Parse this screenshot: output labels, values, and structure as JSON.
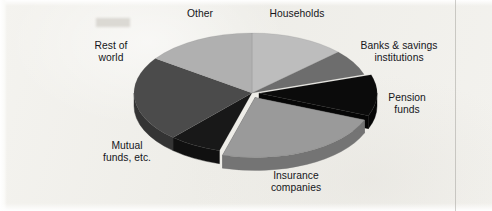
{
  "figure": {
    "background_color": "#f1f0ec",
    "margin_rule_x": 455
  },
  "chart_data": {
    "type": "pie",
    "title": "",
    "subtitle": "",
    "xlabel": "",
    "ylabel": "",
    "legend_position": "none",
    "grid": false,
    "style": "3d-exploded-grayscale",
    "note": "Holders of U.S. corporate equities, shares of total; slice sizes read off the drawn angles.",
    "center": {
      "x": 252,
      "y": 93
    },
    "radius_x": 118,
    "radius_y": 60,
    "depth": 13,
    "start_angle_deg": 0,
    "direction": "clockwise",
    "labels": [
      "Households",
      "Banks & savings institutions",
      "Pension funds",
      "Insurance companies",
      "Mutual funds, etc.",
      "Rest of world",
      "Other"
    ],
    "values": [
      13.1,
      6.9,
      11.1,
      23.3,
      7.2,
      23.1,
      15.3
    ],
    "colors": [
      "#bdbdbd",
      "#6d6d6d",
      "#0b0b0b",
      "#9a9a9a",
      "#181818",
      "#4b4b4b",
      "#b0b0b0"
    ],
    "side_colors": [
      "#8f8f8f",
      "#4d4d4d",
      "#060606",
      "#747474",
      "#101010",
      "#343434",
      "#858585"
    ],
    "slices": [
      {
        "label": "Households",
        "start_deg": 0,
        "end_deg": 47,
        "percent": 13.1,
        "color": "#bdbdbd",
        "exploded": false
      },
      {
        "label": "Banks & savings institutions",
        "start_deg": 47,
        "end_deg": 72,
        "percent": 6.9,
        "color": "#6d6d6d",
        "exploded": false
      },
      {
        "label": "Pension funds",
        "start_deg": 72,
        "end_deg": 112,
        "percent": 11.1,
        "color": "#0b0b0b",
        "exploded": true
      },
      {
        "label": "Insurance companies",
        "start_deg": 112,
        "end_deg": 196,
        "percent": 23.3,
        "color": "#9a9a9a",
        "exploded": true
      },
      {
        "label": "Mutual funds, etc.",
        "start_deg": 196,
        "end_deg": 222,
        "percent": 7.2,
        "color": "#181818",
        "exploded": false
      },
      {
        "label": "Rest of world",
        "start_deg": 222,
        "end_deg": 305,
        "percent": 23.1,
        "color": "#4b4b4b",
        "exploded": false
      },
      {
        "label": "Other",
        "start_deg": 305,
        "end_deg": 360,
        "percent": 15.3,
        "color": "#b0b0b0",
        "exploded": false
      }
    ]
  },
  "callouts": [
    {
      "id": "other",
      "lines": [
        "Other"
      ],
      "x": 169,
      "y": 8,
      "align": "ctr",
      "width": 62
    },
    {
      "id": "households",
      "lines": [
        "Households"
      ],
      "x": 258,
      "y": 8,
      "align": "ctr",
      "width": 78
    },
    {
      "id": "banks",
      "lines": [
        "Banks & savings",
        "institutions"
      ],
      "x": 352,
      "y": 40,
      "align": "ctr",
      "width": 94
    },
    {
      "id": "pension",
      "lines": [
        "Pension",
        "funds"
      ],
      "x": 377,
      "y": 92,
      "align": "ctr",
      "width": 60
    },
    {
      "id": "insurance",
      "lines": [
        "Insurance",
        "companies"
      ],
      "x": 258,
      "y": 170,
      "align": "ctr",
      "width": 76
    },
    {
      "id": "mutual",
      "lines": [
        "Mutual",
        "funds, etc."
      ],
      "x": 90,
      "y": 140,
      "align": "ctr",
      "width": 74
    },
    {
      "id": "restworld",
      "lines": [
        "Rest of",
        "world"
      ],
      "x": 80,
      "y": 40,
      "align": "ctr",
      "width": 62
    }
  ]
}
